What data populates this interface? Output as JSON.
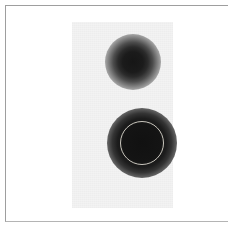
{
  "figure": {
    "caption": "",
    "canvas": {
      "width": 228,
      "height": 231,
      "background_color": "#ffffff"
    },
    "frame": {
      "name": "border-rule",
      "color": "#9e9e9e",
      "bottom_color": "#b4b4b4",
      "left": 5,
      "top": 5,
      "bottom": 222
    },
    "panel": {
      "name": "film-panel",
      "label": "",
      "fill_color": "#f3f3f3",
      "left": 72,
      "top": 22,
      "width": 101,
      "height": 186
    }
  },
  "chart_data": {
    "type": "heatmap",
    "title": "",
    "subtitle": "",
    "xlabel": "",
    "ylabel": "",
    "grid": false,
    "legend": "none",
    "description": "Grayscale film / autoradiograph panel showing two diffuse dark spots on a light background, the lower and larger spot outlined by a thin circular region-of-interest ring.",
    "xlim": [
      72,
      173
    ],
    "ylim": [
      22,
      208
    ],
    "colormap": "grayscale-inverted",
    "background_value_hex": "#f3f3f3",
    "core_value_hex": "#111111",
    "spots": [
      {
        "id": "spot-upper",
        "label": "",
        "center_x": 133,
        "center_y": 62,
        "core_radius": 14,
        "halo_radius": 28,
        "peak_darkness": 0.91,
        "annotated": false
      },
      {
        "id": "spot-lower",
        "label": "",
        "center_x": 142,
        "center_y": 143,
        "core_radius": 22,
        "halo_radius": 35,
        "peak_darkness": 0.95,
        "annotated": true
      }
    ],
    "annotations": [
      {
        "id": "roi-ring",
        "shape": "circle",
        "label": "",
        "center_x": 142,
        "center_y": 143,
        "radius": 22,
        "stroke_color": "#c9c6bd",
        "stroke_width": 1,
        "fill": "none"
      }
    ]
  }
}
